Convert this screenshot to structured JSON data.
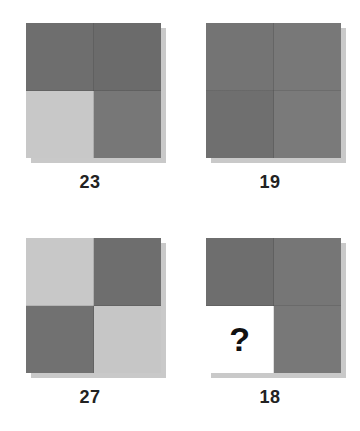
{
  "puzzle": {
    "type": "visual-pattern-matrix",
    "question_mark": "?",
    "palette": {
      "dark_gray": "#6e6e6e",
      "medium_gray": "#767676",
      "light_gray": "#c8c8c8",
      "white": "#ffffff",
      "shadow": "#c9c9c9",
      "label_text": "#222222"
    },
    "tiles": [
      {
        "label": "23",
        "name": "tile-23",
        "quadrants": [
          {
            "position": "top-left",
            "shade": "dark",
            "color": "#6e6e6e",
            "value": ""
          },
          {
            "position": "top-right",
            "shade": "dark",
            "color": "#6b6b6b",
            "value": ""
          },
          {
            "position": "bottom-left",
            "shade": "light",
            "color": "#c8c8c8",
            "value": ""
          },
          {
            "position": "bottom-right",
            "shade": "medium",
            "color": "#777777",
            "value": ""
          }
        ]
      },
      {
        "label": "19",
        "name": "tile-19",
        "quadrants": [
          {
            "position": "top-left",
            "shade": "medium",
            "color": "#747474",
            "value": ""
          },
          {
            "position": "top-right",
            "shade": "medium",
            "color": "#787878",
            "value": ""
          },
          {
            "position": "bottom-left",
            "shade": "medium",
            "color": "#6f6f6f",
            "value": ""
          },
          {
            "position": "bottom-right",
            "shade": "medium",
            "color": "#7a7a7a",
            "value": ""
          }
        ]
      },
      {
        "label": "27",
        "name": "tile-27",
        "quadrants": [
          {
            "position": "top-left",
            "shade": "light",
            "color": "#c8c8c8",
            "value": ""
          },
          {
            "position": "top-right",
            "shade": "dark",
            "color": "#6e6e6e",
            "value": ""
          },
          {
            "position": "bottom-left",
            "shade": "dark",
            "color": "#717171",
            "value": ""
          },
          {
            "position": "bottom-right",
            "shade": "light",
            "color": "#c6c6c6",
            "value": ""
          }
        ]
      },
      {
        "label": "18",
        "name": "tile-18",
        "quadrants": [
          {
            "position": "top-left",
            "shade": "dark",
            "color": "#6e6e6e",
            "value": ""
          },
          {
            "position": "top-right",
            "shade": "medium",
            "color": "#767676",
            "value": ""
          },
          {
            "position": "bottom-left",
            "shade": "white",
            "color": "#ffffff",
            "value": "?"
          },
          {
            "position": "bottom-right",
            "shade": "medium",
            "color": "#787878",
            "value": ""
          }
        ]
      }
    ]
  }
}
